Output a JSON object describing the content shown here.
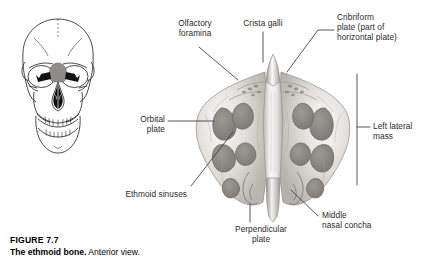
{
  "figure": {
    "number_label": "FIGURE 7.7",
    "title": "The ethmoid bone.",
    "subtitle": "Anterior view.",
    "view": "Anterior view"
  },
  "illustrations": {
    "skull": {
      "name": "anterior-skull-orientation-diagram",
      "description": "Line drawing of anterior skull with ethmoid region highlighted",
      "highlight_color": "#8a8a8a",
      "cavity_color": "#111111",
      "outline_color": "#1b1b1b"
    },
    "bone": {
      "name": "ethmoid-bone-photograph",
      "description": "Grayscale photograph of an isolated ethmoid bone, anterior view",
      "tone_light": "#f2f0ee",
      "tone_mid": "#c8c4c0",
      "tone_dark": "#8e8a86",
      "tone_shadow": "#6b6764"
    }
  },
  "labels": [
    {
      "id": "olfactory-foramina",
      "text": "Olfactory\nforamina"
    },
    {
      "id": "crista-galli",
      "text": "Crista galli"
    },
    {
      "id": "cribriform-plate",
      "text": "Cribriform\nplate (part of\nhorizontal plate)"
    },
    {
      "id": "orbital-plate",
      "text": "Orbital\nplate"
    },
    {
      "id": "left-lateral-mass",
      "text": "Left lateral\nmass"
    },
    {
      "id": "ethmoid-sinuses",
      "text": "Ethmoid sinuses"
    },
    {
      "id": "perpendicular-plate",
      "text": "Perpendicular\nplate"
    },
    {
      "id": "middle-nasal-concha",
      "text": "Middle\nnasal concha"
    }
  ],
  "style": {
    "leader_color": "#3a3a3a",
    "text_color": "#2b2b2b",
    "background": "#ffffff"
  }
}
